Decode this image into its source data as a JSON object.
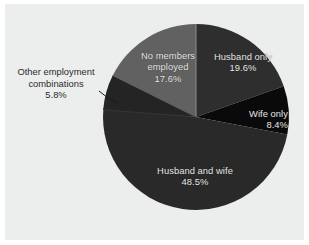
{
  "figure": {
    "background_color": "#eceded",
    "outer_margin_color": "#ffffff",
    "leader_line_color": "#1a1a1a"
  },
  "chart_data": {
    "type": "pie",
    "title": "",
    "subtitle": "",
    "xlabel": "",
    "ylabel": "",
    "grid": false,
    "legend_position": "none",
    "label_format": "name + percent",
    "start_angle_deg": 0,
    "direction": "clockwise",
    "categories": [
      "Husband only",
      "Wife only",
      "Husband and wife",
      "Other employment combinations",
      "No members employed"
    ],
    "values": [
      19.6,
      8.4,
      48.5,
      5.8,
      17.6
    ],
    "value_labels": [
      "19.6%",
      "8.4%",
      "48.5%",
      "5.8%",
      "17.6%"
    ],
    "colors": [
      "#2e2e2e",
      "#0a0a0a",
      "#292929",
      "#242424",
      "#616161"
    ],
    "slices": [
      {
        "name": "Husband only",
        "value": 19.6,
        "value_label": "19.6%",
        "color": "#2e2e2e",
        "start_angle_deg": 0.0,
        "end_angle_deg": 70.56,
        "label_placement": "inside",
        "label_text_color": "#e8e8e8"
      },
      {
        "name": "Wife only",
        "value": 8.4,
        "value_label": "8.4%",
        "color": "#0a0a0a",
        "start_angle_deg": 70.56,
        "end_angle_deg": 100.8,
        "label_placement": "inside",
        "label_text_color": "#e8e8e8"
      },
      {
        "name": "Husband and wife",
        "value": 48.5,
        "value_label": "48.5%",
        "color": "#292929",
        "start_angle_deg": 100.8,
        "end_angle_deg": 275.4,
        "label_placement": "inside",
        "label_text_color": "#e8e8e8"
      },
      {
        "name": "Other employment combinations",
        "value": 5.8,
        "value_label": "5.8%",
        "color": "#242424",
        "start_angle_deg": 275.4,
        "end_angle_deg": 296.28,
        "label_placement": "outside-left-with-leader-line",
        "label_text_color": "#2b2b2b"
      },
      {
        "name": "No members employed",
        "value": 17.6,
        "value_label": "17.6%",
        "color": "#616161",
        "start_angle_deg": 296.28,
        "end_angle_deg": 360.0,
        "label_placement": "inside",
        "label_text_color": "#e8e8e8"
      }
    ]
  },
  "labels": {
    "no_members_employed": "No members\nemployed\n17.6%",
    "husband_only": "Husband only\n19.6%",
    "wife_only": "Wife only\n8.4%",
    "husband_and_wife": "Husband and wife\n48.5%",
    "other_employment": "Other employment\ncombinations\n5.8%"
  }
}
